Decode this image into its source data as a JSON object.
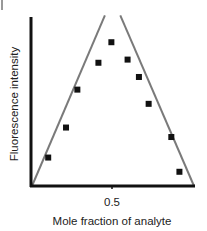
{
  "chart_data": {
    "type": "scatter",
    "title": "",
    "xlabel": "Mole fraction of analyte",
    "ylabel": "Fluorescence intensity",
    "xticks": [
      0.5
    ],
    "xtick_labels": [
      "0.5"
    ],
    "xlim": [
      0,
      1
    ],
    "ylim": [
      0,
      1.08
    ],
    "grid": false,
    "legend": null,
    "series": [
      {
        "name": "data points",
        "marker": "square",
        "color": "#111111",
        "x": [
          0.1,
          0.21,
          0.28,
          0.41,
          0.49,
          0.59,
          0.66,
          0.72,
          0.86,
          0.91
        ],
        "y": [
          0.18,
          0.37,
          0.61,
          0.78,
          0.91,
          0.8,
          0.69,
          0.52,
          0.31,
          0.09
        ]
      },
      {
        "name": "ascending fit line",
        "type": "line",
        "color": "#7a7a7a",
        "x": [
          0.0,
          0.45
        ],
        "y": [
          0.0,
          1.08
        ]
      },
      {
        "name": "descending fit line",
        "type": "line",
        "color": "#7a7a7a",
        "x": [
          0.545,
          1.0
        ],
        "y": [
          1.08,
          0.0
        ]
      }
    ],
    "annotations": [
      "Lines intersect at mole fraction 0.5 (Job plot stoichiometry maximum)"
    ]
  },
  "labels": {
    "xlabel": "Mole fraction of analyte",
    "ylabel": "Fluorescence intensity",
    "xtick": "0.5"
  }
}
